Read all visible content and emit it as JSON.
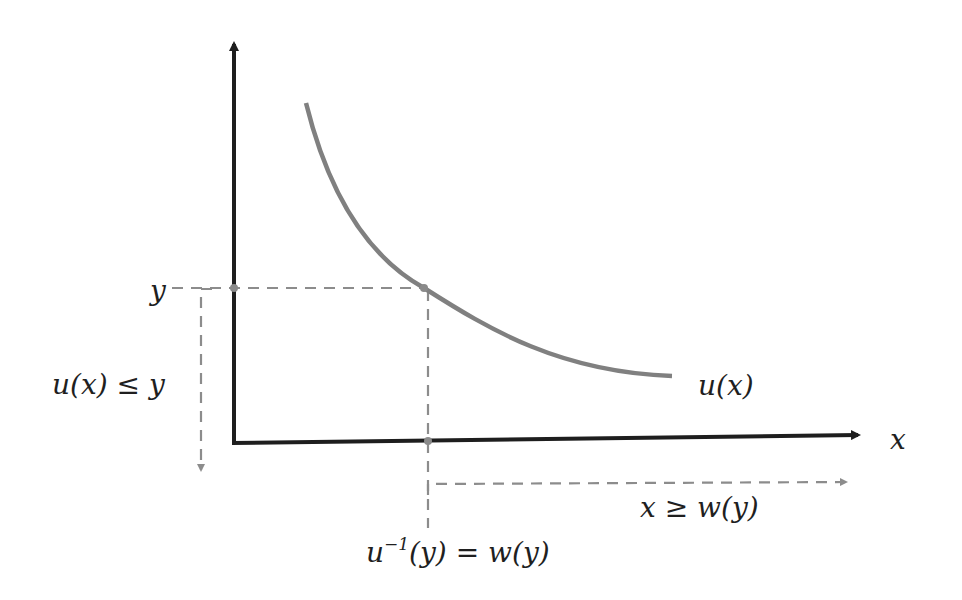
{
  "diagram": {
    "colors": {
      "axis": "#1e1e1e",
      "curve": "#808080",
      "dashed": "#8c8c8c",
      "text": "#1f1f1f",
      "background": "#ffffff"
    },
    "axes": {
      "x_label": "x",
      "y_axis_label": ""
    },
    "curve": {
      "label": "u(x)",
      "description": "decreasing convex function"
    },
    "labels": {
      "y_level": "y",
      "region_y": "u(x) ≤ y",
      "inverse_base": "u",
      "inverse_sup": "−1",
      "inverse_rest": "(y) = w(y)",
      "region_x": "x ≥ w(y)"
    },
    "points": [
      {
        "name": "y-intercept-on-axis",
        "x": 234,
        "y": 288
      },
      {
        "name": "curve-point",
        "x": 424,
        "y": 288
      },
      {
        "name": "x-axis-point",
        "x": 428,
        "y": 441
      }
    ]
  }
}
